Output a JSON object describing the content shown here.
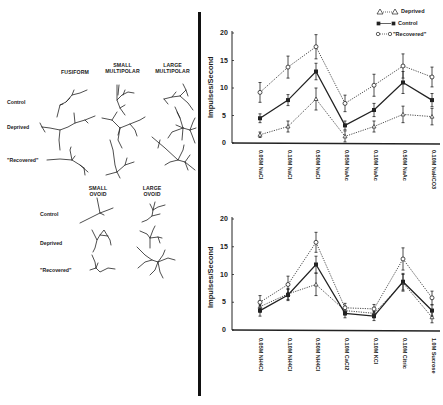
{
  "neuron_panel": {
    "top_group": {
      "column_headers": [
        "FUSIFORM",
        "SMALL\nMULTIPOLAR",
        "LARGE\nMULTIPOLAR"
      ],
      "row_labels": [
        "Control",
        "Deprived",
        "\"Recovered\""
      ]
    },
    "bottom_group": {
      "column_headers": [
        "SMALL\nOVOID",
        "LARGE\nOVOID"
      ],
      "row_labels": [
        "Control",
        "Deprived",
        "\"Recovered\""
      ]
    }
  },
  "legend": {
    "items": [
      {
        "label": "Deprived",
        "marker": "open-triangle",
        "line": "dotted"
      },
      {
        "label": "Control",
        "marker": "filled-square",
        "line": "solid"
      },
      {
        "label": "\"Recovered\"",
        "marker": "open-circle",
        "line": "dotted"
      }
    ]
  },
  "chart_data": [
    {
      "type": "line",
      "title": "",
      "xlabel": "",
      "ylabel": "Impulses/Second",
      "ylim": [
        0,
        20
      ],
      "yticks": [
        0,
        5,
        10,
        15,
        20
      ],
      "grid": false,
      "legend_position": "top-right",
      "categories": [
        "0.05M NaCl",
        "0.10M NaCl",
        "0.50M NaCl",
        "0.05M NaAc",
        "0.10M NaAc",
        "0.50M NaAc",
        "0.10M NaHCO3"
      ],
      "series": [
        {
          "name": "Deprived",
          "style": "dotted",
          "marker": "open-triangle",
          "values": [
            1.5,
            3.0,
            8.0,
            1.2,
            3.0,
            5.2,
            4.8
          ],
          "errors": [
            0.5,
            1.0,
            2.0,
            1.0,
            1.0,
            1.5,
            1.5
          ]
        },
        {
          "name": "Control",
          "style": "solid",
          "marker": "filled-square",
          "values": [
            4.5,
            7.8,
            13.0,
            3.2,
            6.0,
            11.0,
            7.8
          ],
          "errors": [
            0.8,
            1.0,
            1.5,
            0.8,
            1.2,
            2.0,
            1.2
          ]
        },
        {
          "name": "\"Recovered\"",
          "style": "dotted",
          "marker": "open-circle",
          "values": [
            9.2,
            13.8,
            17.5,
            7.2,
            10.5,
            14.0,
            12.0
          ],
          "errors": [
            1.8,
            2.0,
            2.2,
            1.5,
            2.0,
            2.2,
            1.8
          ]
        }
      ]
    },
    {
      "type": "line",
      "title": "",
      "xlabel": "",
      "ylabel": "Impulses/Second",
      "ylim": [
        0,
        20
      ],
      "yticks": [
        0,
        5,
        10,
        15,
        20
      ],
      "grid": false,
      "categories": [
        "0.05M NH4Cl",
        "0.10M NH4Cl",
        "0.50M NH4Cl",
        "0.10M CaCl2",
        "0.10M KCl",
        "0.10M Citric",
        "1.0M Sucrose"
      ],
      "series": [
        {
          "name": "Deprived",
          "style": "dotted",
          "marker": "open-triangle",
          "values": [
            4.2,
            6.5,
            8.2,
            3.5,
            3.0,
            8.5,
            2.3
          ],
          "errors": [
            1.0,
            1.0,
            2.0,
            0.8,
            0.8,
            1.5,
            1.0
          ]
        },
        {
          "name": "Control",
          "style": "solid",
          "marker": "filled-square",
          "values": [
            3.5,
            6.3,
            11.8,
            3.0,
            2.5,
            8.7,
            3.5
          ],
          "errors": [
            1.0,
            1.0,
            1.5,
            0.8,
            0.8,
            1.5,
            1.0
          ]
        },
        {
          "name": "\"Recovered\"",
          "style": "dotted",
          "marker": "open-circle",
          "values": [
            5.0,
            8.2,
            15.8,
            4.0,
            3.8,
            12.8,
            5.8
          ],
          "errors": [
            1.2,
            1.5,
            1.8,
            0.8,
            0.8,
            2.0,
            1.2
          ]
        }
      ]
    }
  ]
}
